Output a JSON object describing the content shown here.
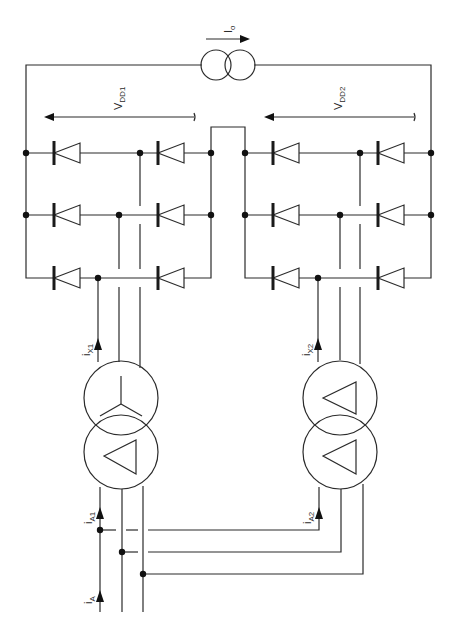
{
  "diagram": {
    "colors": {
      "line": "#2b2b2b",
      "node": "#111111",
      "background": "#ffffff"
    },
    "load": {
      "label_main": "I",
      "label_sub": "o",
      "symbol": "current-source-icon"
    },
    "bridge1": {
      "voltage_label_main": "V",
      "voltage_label_sub": "DD1",
      "diodes": 6
    },
    "bridge2": {
      "voltage_label_main": "V",
      "voltage_label_sub": "DD2",
      "diodes": 6
    },
    "transformer1": {
      "primary": "delta",
      "secondary": "wye",
      "secondary_current_main": "i",
      "secondary_current_sub": "X1",
      "primary_current_main": "i",
      "primary_current_sub": "A1"
    },
    "transformer2": {
      "primary": "delta",
      "secondary": "delta",
      "secondary_current_main": "i",
      "secondary_current_sub": "X2",
      "primary_current_main": "i",
      "primary_current_sub": "A2"
    },
    "supply": {
      "current_main": "i",
      "current_sub": "A"
    }
  }
}
